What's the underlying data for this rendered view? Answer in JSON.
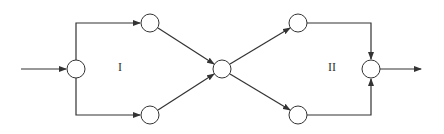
{
  "diagram": {
    "type": "network-flow",
    "stroke_color": "#333333",
    "background": "#ffffff",
    "node_radius": 9,
    "nodes": [
      {
        "id": "in",
        "cx": 76,
        "cy": 69
      },
      {
        "id": "tl",
        "cx": 150,
        "cy": 23
      },
      {
        "id": "bl",
        "cx": 150,
        "cy": 115
      },
      {
        "id": "mid",
        "cx": 222,
        "cy": 69
      },
      {
        "id": "tr",
        "cx": 298,
        "cy": 23
      },
      {
        "id": "br",
        "cx": 298,
        "cy": 115
      },
      {
        "id": "out",
        "cx": 371,
        "cy": 69
      }
    ],
    "edges": [
      {
        "from": "source",
        "to": "in",
        "shape": "straight"
      },
      {
        "from": "in",
        "to": "tl",
        "shape": "elbow-up"
      },
      {
        "from": "in",
        "to": "bl",
        "shape": "elbow-down"
      },
      {
        "from": "tl",
        "to": "mid",
        "shape": "diagonal"
      },
      {
        "from": "bl",
        "to": "mid",
        "shape": "diagonal"
      },
      {
        "from": "mid",
        "to": "tr",
        "shape": "diagonal"
      },
      {
        "from": "mid",
        "to": "br",
        "shape": "diagonal"
      },
      {
        "from": "tr",
        "to": "out",
        "shape": "elbow-down"
      },
      {
        "from": "br",
        "to": "out",
        "shape": "elbow-up"
      },
      {
        "from": "out",
        "to": "sink",
        "shape": "straight"
      }
    ],
    "labels": {
      "region_1": "I",
      "region_2": "II"
    }
  }
}
